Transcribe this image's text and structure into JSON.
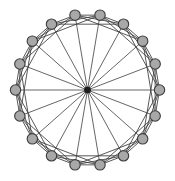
{
  "figure": {
    "background_color": "#ffffff",
    "width": 175,
    "height": 181
  },
  "chart_data": {
    "type": "diagram",
    "diagram_type": "node-link-graph",
    "layout": "circular",
    "node_count_outer": 18,
    "node_count_hub": 1,
    "node_count_total": 19,
    "center": {
      "x": 87.5,
      "y": 90.0
    },
    "radius_x": 72.0,
    "radius_y": 76.0,
    "start_angle_deg": -100,
    "chord_steps": [
      1,
      2,
      3
    ],
    "hub_connected_to_all": true,
    "colors": {
      "node_fill": "#a8a8a8",
      "node_stroke": "#3c3c3c",
      "hub_fill": "#1e1e1e",
      "edge_stroke": "#3a3a3a",
      "spoke_stroke": "#3f3f3f",
      "background": "#ffffff"
    },
    "node_radius": 5.2,
    "hub_radius": 3.0,
    "edge_width": 0.85,
    "nodes": [
      {
        "id": 0,
        "label": "n0",
        "angle_deg": -100
      },
      {
        "id": 1,
        "label": "n1",
        "angle_deg": -80
      },
      {
        "id": 2,
        "label": "n2",
        "angle_deg": -60
      },
      {
        "id": 3,
        "label": "n3",
        "angle_deg": -40
      },
      {
        "id": 4,
        "label": "n4",
        "angle_deg": -20
      },
      {
        "id": 5,
        "label": "n5",
        "angle_deg": 0
      },
      {
        "id": 6,
        "label": "n6",
        "angle_deg": 20
      },
      {
        "id": 7,
        "label": "n7",
        "angle_deg": 40
      },
      {
        "id": 8,
        "label": "n8",
        "angle_deg": 60
      },
      {
        "id": 9,
        "label": "n9",
        "angle_deg": 80
      },
      {
        "id": 10,
        "label": "n10",
        "angle_deg": 100
      },
      {
        "id": 11,
        "label": "n11",
        "angle_deg": 120
      },
      {
        "id": 12,
        "label": "n12",
        "angle_deg": 140
      },
      {
        "id": 13,
        "label": "n13",
        "angle_deg": 160
      },
      {
        "id": 14,
        "label": "n14",
        "angle_deg": 180
      },
      {
        "id": 15,
        "label": "n15",
        "angle_deg": 200
      },
      {
        "id": 16,
        "label": "n16",
        "angle_deg": 220
      },
      {
        "id": 17,
        "label": "n17",
        "angle_deg": 240
      },
      {
        "id": 18,
        "label": "hub",
        "angle_deg": null,
        "is_hub": true
      }
    ]
  }
}
